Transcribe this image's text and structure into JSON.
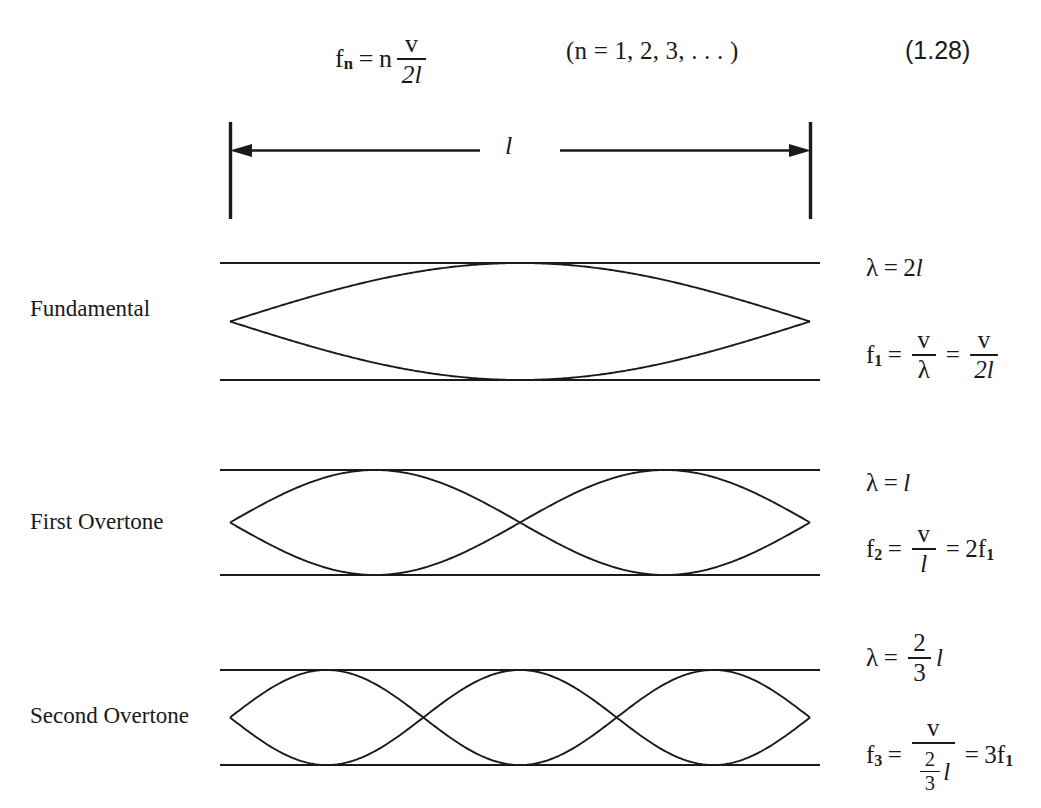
{
  "figure": {
    "equation_number": "(1.28)",
    "main_equation": {
      "lhs_symbol": "f",
      "lhs_subscript": "n",
      "equals": "=",
      "multiplier": "n",
      "fraction_numerator": "v",
      "fraction_denominator": "2l",
      "range_note": "(n = 1, 2, 3, . . . )"
    },
    "dimension": {
      "label": "l",
      "left_bar_x": 230,
      "right_bar_x": 810
    },
    "rows": [
      {
        "label": "Fundamental",
        "harmonic": 1,
        "lobes": 1,
        "top_y": 263,
        "bottom_y": 380,
        "wavelength": {
          "symbol": "λ",
          "equals": "=",
          "value_prefix": "2",
          "value_unit": "l"
        },
        "frequency": {
          "symbol": "f",
          "subscript": "1",
          "equals": "=",
          "first_numerator": "v",
          "first_denominator": "λ",
          "equals2": "=",
          "second_numerator": "v",
          "second_denominator": "2l"
        }
      },
      {
        "label": "First Overtone",
        "harmonic": 2,
        "lobes": 2,
        "top_y": 470,
        "bottom_y": 575,
        "wavelength": {
          "symbol": "λ",
          "equals": "=",
          "value_prefix": "",
          "value_unit": "l"
        },
        "frequency": {
          "symbol": "f",
          "subscript": "2",
          "equals": "=",
          "first_numerator": "v",
          "first_denominator": "l",
          "equals2": "=",
          "result_coefficient": "2",
          "result_symbol": "f",
          "result_subscript": "1"
        }
      },
      {
        "label": "Second Overtone",
        "harmonic": 3,
        "lobes": 3,
        "top_y": 670,
        "bottom_y": 765,
        "wavelength": {
          "symbol": "λ",
          "equals": "=",
          "frac_num": "2",
          "frac_den": "3",
          "value_unit": "l"
        },
        "frequency": {
          "symbol": "f",
          "subscript": "3",
          "equals": "=",
          "first_numerator": "v",
          "den_frac_num": "2",
          "den_frac_den": "3",
          "den_unit": "l",
          "equals2": "=",
          "result_coefficient": "3",
          "result_symbol": "f",
          "result_subscript": "1"
        }
      }
    ],
    "colors": {
      "ink": "#1a1a1a",
      "background": "#ffffff"
    }
  }
}
